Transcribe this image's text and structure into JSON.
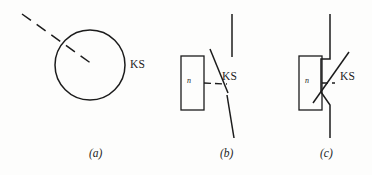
{
  "figure": {
    "title": "",
    "background_color": "#fdfdfc",
    "stroke_color": "#1c1c1c",
    "subfigure_count": 3
  },
  "labels": {
    "ks_a": "KS",
    "ks_b": "KS",
    "ks_c": "KS",
    "coil_glyph_b": "n",
    "coil_glyph_c": "n"
  },
  "captions": {
    "a": "(a)",
    "b": "(b)",
    "c": "(c)"
  },
  "diagram_data": {
    "type": "schematic",
    "description": "Three graphical symbol variants for a travel/limit switch designated KS",
    "subfigures": [
      {
        "id": "a",
        "caption": "(a)",
        "label": "KS",
        "elements": [
          {
            "name": "circle-body",
            "shape": "circle",
            "cx": 90,
            "cy": 65,
            "r": 35
          },
          {
            "name": "actuating-arm",
            "shape": "dashed-line",
            "x1": 22,
            "y1": 14,
            "x2": 92,
            "y2": 64
          }
        ]
      },
      {
        "id": "b",
        "caption": "(b)",
        "label": "KS",
        "coil_symbol": "n",
        "elements": [
          {
            "name": "coil-rectangle",
            "shape": "rect",
            "x": 181,
            "y": 56,
            "width": 23,
            "height": 54
          },
          {
            "name": "dashed-link",
            "shape": "dashed-line",
            "x1": 204,
            "y1": 83,
            "x2": 226,
            "y2": 83
          },
          {
            "name": "upper-terminal-lead",
            "shape": "line",
            "x1": 232,
            "y1": 14,
            "x2": 232,
            "y2": 57
          },
          {
            "name": "switch-blade",
            "shape": "line",
            "x1": 210,
            "y1": 49,
            "x2": 228,
            "y2": 93
          },
          {
            "name": "lower-terminal-lead",
            "shape": "line",
            "x1": 228,
            "y1": 96,
            "x2": 233,
            "y2": 138
          }
        ]
      },
      {
        "id": "c",
        "caption": "(c)",
        "label": "KS",
        "coil_symbol": "n",
        "elements": [
          {
            "name": "coil-rectangle",
            "shape": "rect",
            "x": 299,
            "y": 56,
            "width": 23,
            "height": 54
          },
          {
            "name": "dashed-link",
            "shape": "dashed-line",
            "x1": 322,
            "y1": 83,
            "x2": 334,
            "y2": 83
          },
          {
            "name": "upper-terminal-lead",
            "shape": "line",
            "x1": 330,
            "y1": 14,
            "x2": 330,
            "y2": 59
          },
          {
            "name": "upper-jog",
            "shape": "line",
            "x1": 330,
            "y1": 59,
            "x2": 322,
            "y2": 59
          },
          {
            "name": "contact-stem-upper",
            "shape": "line",
            "x1": 322,
            "y1": 59,
            "x2": 322,
            "y2": 83
          },
          {
            "name": "switch-blade",
            "shape": "line",
            "x1": 315,
            "y1": 102,
            "x2": 348,
            "y2": 52
          },
          {
            "name": "lower-jog",
            "shape": "line",
            "x1": 322,
            "y1": 90,
            "x2": 330,
            "y2": 104
          },
          {
            "name": "lower-terminal-lead",
            "shape": "line",
            "x1": 330,
            "y1": 104,
            "x2": 330,
            "y2": 138
          }
        ]
      }
    ]
  }
}
